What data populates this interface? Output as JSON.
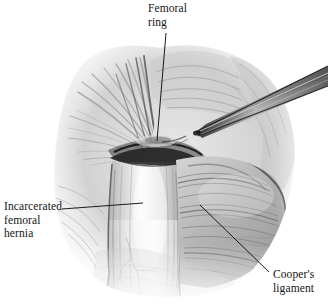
{
  "figure": {
    "medium": "pencil-and-graphite medical illustration",
    "background_color": "#ffffff",
    "ink_color": "#141414",
    "width": 328,
    "height": 308
  },
  "labels": {
    "femoral_ring": {
      "text": "Femoral\nring",
      "lines": [
        "Femoral",
        "ring"
      ],
      "leader": {
        "x1": 166,
        "y1": 33,
        "x2": 157,
        "y2": 141
      }
    },
    "incarcerated_femoral_hernia": {
      "text": "Incarcerated\nfemoral\nhernia",
      "lines": [
        "Incarcerated",
        "femoral",
        "hernia"
      ],
      "leader": {
        "x1": 62,
        "y1": 209,
        "x2": 143,
        "y2": 203
      }
    },
    "coopers_ligament": {
      "text": "Cooper's\nligament",
      "lines": [
        "Cooper's",
        "ligament"
      ],
      "leader": {
        "x1": 200,
        "y1": 205,
        "x2": 269,
        "y2": 272
      }
    }
  },
  "anatomy": {
    "structures": [
      {
        "name": "hernia-sac",
        "description": "bulging incarcerated femoral hernia sac, bright highlighted vertical mass"
      },
      {
        "name": "femoral-ring",
        "description": "dark constricting ring at hernia neck"
      },
      {
        "name": "coopers-ligament",
        "description": "striated fibrous ligament on right of field"
      },
      {
        "name": "fascial-striations",
        "description": "radiating fibrous tissue upper left"
      },
      {
        "name": "surgical-instrument",
        "description": "forceps entering from upper right toward femoral ring"
      }
    ]
  }
}
